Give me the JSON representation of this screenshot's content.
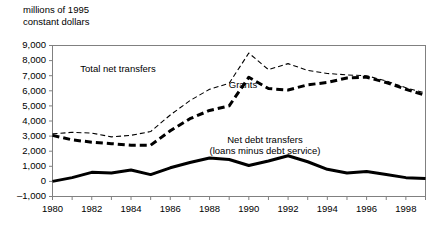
{
  "chart_data": {
    "type": "line",
    "title": "",
    "ylabel": "millions of 1995\nconstant dollars",
    "xlabel": "",
    "ylim": [
      -1000,
      9000
    ],
    "xlim": [
      1980,
      1999
    ],
    "grid": false,
    "legend_position": "inline-annotations",
    "ytick_labels": [
      "9,000",
      "8,000",
      "7,000",
      "6,000",
      "5,000",
      "4,000",
      "3,000",
      "2,000",
      "1,000",
      "0",
      "–1,000"
    ],
    "ytick_values": [
      9000,
      8000,
      7000,
      6000,
      5000,
      4000,
      3000,
      2000,
      1000,
      0,
      -1000
    ],
    "xtick_labels": [
      "1980",
      "1982",
      "1984",
      "1986",
      "1988",
      "1990",
      "1992",
      "1994",
      "1996",
      "1998"
    ],
    "xtick_values": [
      1980,
      1982,
      1984,
      1986,
      1988,
      1990,
      1992,
      1994,
      1996,
      1998
    ],
    "x": [
      1980,
      1981,
      1982,
      1983,
      1984,
      1985,
      1986,
      1987,
      1988,
      1989,
      1990,
      1991,
      1992,
      1993,
      1994,
      1995,
      1996,
      1997,
      1998,
      1999
    ],
    "series": [
      {
        "name": "Total net transfers",
        "style": "thin-dashed",
        "color": "#000000",
        "values": [
          3150,
          3250,
          3200,
          2950,
          3050,
          3300,
          4400,
          5350,
          6100,
          6500,
          8500,
          7400,
          7800,
          7350,
          7150,
          7050,
          7000,
          6650,
          6200,
          5850
        ]
      },
      {
        "name": "Grants",
        "style": "thick-dashed",
        "color": "#000000",
        "values": [
          3050,
          2750,
          2600,
          2500,
          2400,
          2400,
          3350,
          4150,
          4700,
          5000,
          6900,
          6150,
          6050,
          6400,
          6550,
          6850,
          6900,
          6550,
          6100,
          5700
        ]
      },
      {
        "name": "Net debt transfers",
        "style": "thick-solid",
        "color": "#000000",
        "values": [
          0,
          250,
          600,
          550,
          750,
          450,
          900,
          1250,
          1550,
          1450,
          1050,
          1350,
          1700,
          1300,
          800,
          550,
          650,
          450,
          250,
          200
        ]
      }
    ],
    "annotations": [
      {
        "name": "total-net-transfers-label",
        "text": "Total net transfers",
        "x_px": 118,
        "y_px": 63
      },
      {
        "name": "grants-label",
        "text": "Grants",
        "x_px": 243,
        "y_px": 79
      },
      {
        "name": "net-debt-transfers-label",
        "text": "Net debt transfers\n(loans minus debt service)",
        "x_px": 265,
        "y_px": 134
      }
    ]
  },
  "figure": {
    "unit_caption": "millions of 1995\nconstant dollars",
    "background_color": "#ffffff",
    "line_color": "#000000",
    "axis_color": "#808080"
  }
}
